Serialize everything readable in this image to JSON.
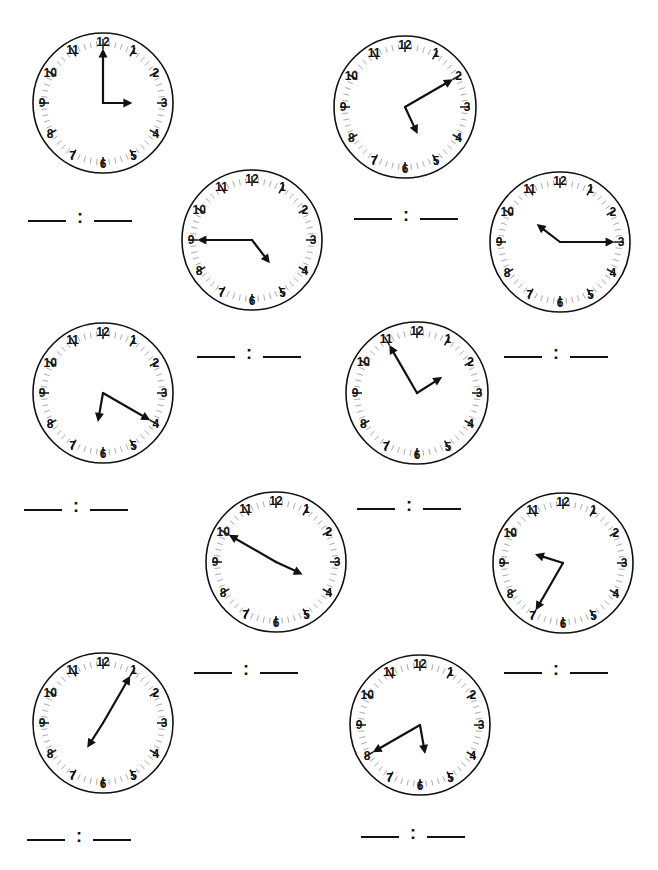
{
  "worksheet": {
    "clock_numbers": [
      "12",
      "1",
      "2",
      "3",
      "4",
      "5",
      "6",
      "7",
      "8",
      "9",
      "10",
      "11"
    ],
    "answer_separator": ":",
    "clocks": [
      {
        "id": 1,
        "cx": 103,
        "cy": 103,
        "r": 70,
        "time": "3:00",
        "hour": 3,
        "minute": 0
      },
      {
        "id": 2,
        "cx": 405,
        "cy": 107,
        "r": 71,
        "time": "5:10",
        "hour": 5,
        "minute": 10
      },
      {
        "id": 3,
        "cx": 252,
        "cy": 240,
        "r": 70,
        "time": "4:45",
        "hour": 4,
        "minute": 45
      },
      {
        "id": 4,
        "cx": 560,
        "cy": 242,
        "r": 70,
        "time": "10:15",
        "hour": 10,
        "minute": 15
      },
      {
        "id": 5,
        "cx": 103,
        "cy": 393,
        "r": 70,
        "time": "6:20",
        "hour": 6,
        "minute": 20
      },
      {
        "id": 6,
        "cx": 417,
        "cy": 393,
        "r": 71,
        "time": "1:55",
        "hour": 1,
        "minute": 55
      },
      {
        "id": 7,
        "cx": 276,
        "cy": 562,
        "r": 70,
        "time": "3:50",
        "hour": 3,
        "minute": 50
      },
      {
        "id": 8,
        "cx": 563,
        "cy": 563,
        "r": 70,
        "time": "9:35",
        "hour": 9,
        "minute": 35
      },
      {
        "id": 9,
        "cx": 103,
        "cy": 723,
        "r": 70,
        "time": "7:05",
        "hour": 7,
        "minute": 5
      },
      {
        "id": 10,
        "cx": 420,
        "cy": 725,
        "r": 70,
        "time": "5:40",
        "hour": 5,
        "minute": 40
      }
    ],
    "answer_blanks": [
      {
        "id": 1,
        "x": 28,
        "y": 198
      },
      {
        "id": 2,
        "x": 354,
        "y": 196
      },
      {
        "id": 3,
        "x": 197,
        "y": 334
      },
      {
        "id": 4,
        "x": 504,
        "y": 334
      },
      {
        "id": 5,
        "x": 24,
        "y": 487
      },
      {
        "id": 6,
        "x": 357,
        "y": 486
      },
      {
        "id": 7,
        "x": 194,
        "y": 650
      },
      {
        "id": 8,
        "x": 504,
        "y": 650
      },
      {
        "id": 9,
        "x": 27,
        "y": 817
      },
      {
        "id": 10,
        "x": 361,
        "y": 814
      }
    ]
  }
}
